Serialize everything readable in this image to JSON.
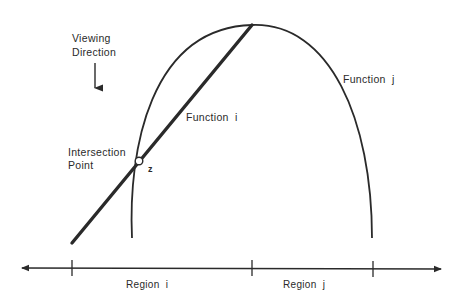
{
  "diagram": {
    "viewing_direction": {
      "line1": "Viewing",
      "line2": "Direction",
      "icon": "arrow-down-icon"
    },
    "intersection": {
      "line1": "Intersection",
      "line2": "Point",
      "point_label": "z"
    },
    "function_i_label": "Function  i",
    "function_j_label": "Function  j",
    "axis": {
      "regions": [
        {
          "label": "Region  i"
        },
        {
          "label": "Region  j"
        }
      ]
    },
    "colors": {
      "ink": "#2a2a2a",
      "background": "#ffffff"
    }
  }
}
